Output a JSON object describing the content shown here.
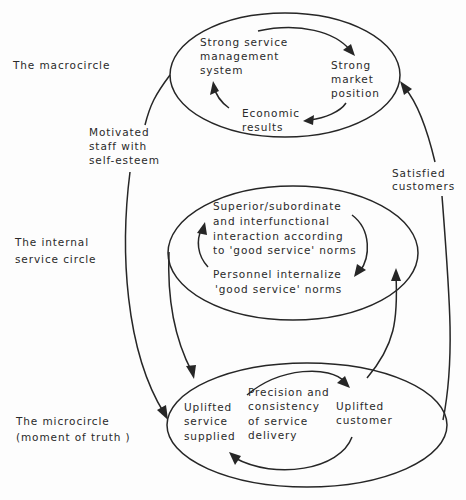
{
  "diagram": {
    "levels": {
      "macro": [
        "The macrocircle"
      ],
      "internal": [
        "The internal",
        "service circle"
      ],
      "micro": [
        "The microcircle",
        "(moment of truth )"
      ]
    },
    "macrocircle": {
      "nodes": {
        "management": [
          "Strong service",
          "management",
          "system"
        ],
        "market": [
          "Strong",
          "market",
          "position"
        ],
        "economic": [
          "Economic",
          "results"
        ]
      }
    },
    "internal_circle": {
      "nodes": {
        "interaction": [
          "Superior/subordinate",
          "and interfunctional",
          "interaction according",
          "to 'good service' norms"
        ],
        "internalize": [
          "Personnel internalize",
          "'good service' norms"
        ]
      }
    },
    "microcircle": {
      "nodes": {
        "supplied": [
          "Uplifted",
          "service",
          "supplied"
        ],
        "precision": [
          "Precision and",
          "consistency",
          "of service",
          "delivery"
        ],
        "customer": [
          "Uplifted",
          "customer"
        ]
      }
    },
    "links": {
      "motivated_staff": [
        "Motivated",
        "staff with",
        "self-esteem"
      ],
      "satisfied_customers": [
        "Satisfied",
        "customers"
      ]
    },
    "colors": {
      "ink": "#262626",
      "paper": "#fdfdfd"
    }
  }
}
